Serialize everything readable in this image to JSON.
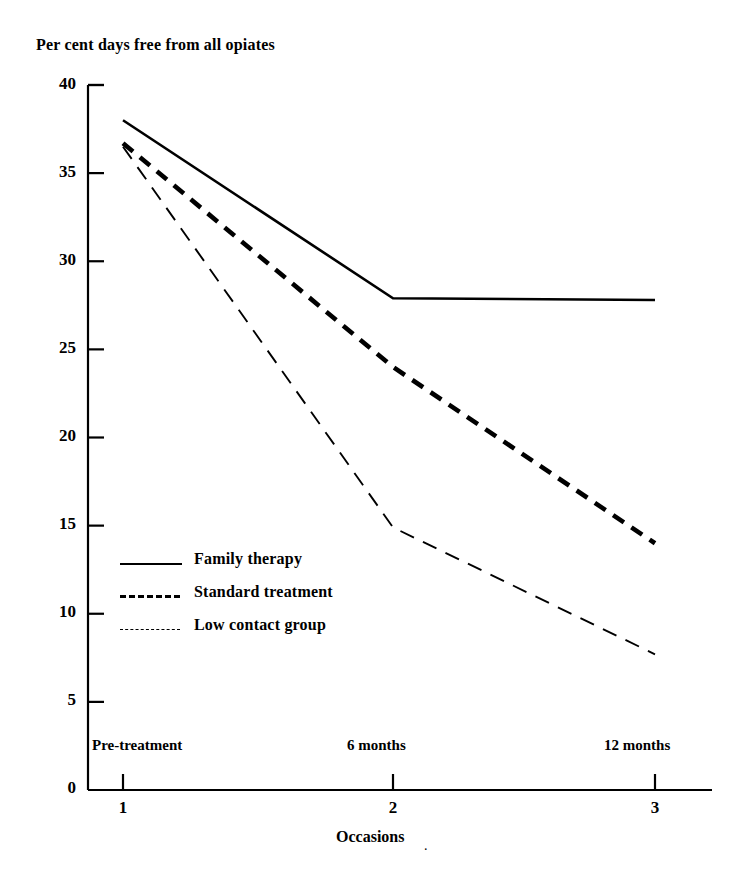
{
  "chart_data": {
    "type": "line",
    "title": "Per cent days free from all opiates",
    "xlabel": "Occasions",
    "ylabel": "",
    "ylim": [
      0,
      40
    ],
    "yticks": [
      0,
      5,
      10,
      15,
      20,
      25,
      30,
      35,
      40
    ],
    "ytick_labels": [
      "0",
      "5",
      "10",
      "15",
      "20",
      "25",
      "30",
      "35",
      "40"
    ],
    "grid": false,
    "x": [
      1,
      2,
      3
    ],
    "xtick_labels": [
      "1",
      "2",
      "3"
    ],
    "categories": [
      "Pre-treatment",
      "6 months",
      "12 months"
    ],
    "legend_position": "inside lower-left",
    "series": [
      {
        "name": "Family therapy",
        "style": "solid",
        "values": [
          38.0,
          27.9,
          27.8
        ]
      },
      {
        "name": "Standard treatment",
        "style": "thick-dashed",
        "values": [
          36.7,
          24.0,
          14.0
        ]
      },
      {
        "name": "Low contact group",
        "style": "thin-dashed",
        "values": [
          36.5,
          14.9,
          7.7
        ]
      }
    ]
  },
  "axes": {
    "y_tick_labels": [
      "40",
      "35",
      "30",
      "25",
      "20",
      "15",
      "10",
      "5",
      "0"
    ],
    "x_number_labels": [
      "1",
      "2",
      "3"
    ],
    "x_category_labels": [
      "Pre-treatment",
      "6 months",
      "12 months"
    ],
    "x_axis_name": "Occasions",
    "trailing_mark": "."
  },
  "legend": {
    "items": [
      {
        "label": "Family therapy",
        "style": "solid"
      },
      {
        "label": "Standard treatment",
        "style": "thick-dashed"
      },
      {
        "label": "Low contact group",
        "style": "thin-dashed"
      }
    ]
  },
  "colors": {
    "ink": "#000000",
    "paper": "#ffffff"
  }
}
